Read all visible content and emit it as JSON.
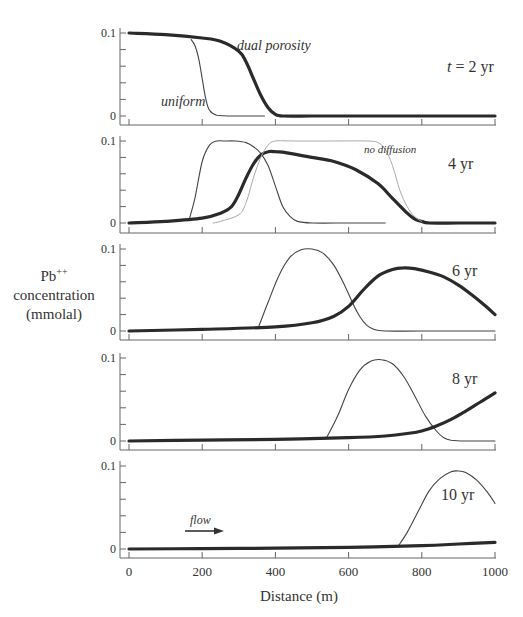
{
  "chart_data": {
    "type": "line",
    "title": "",
    "xlabel": "Distance (m)",
    "ylabel": "Pb++ concentration (mmolal)",
    "ylabel_parts": {
      "main": "Pb",
      "sup": "++",
      "line2": "concentration",
      "line3": "(mmolal)"
    },
    "xlim": [
      0,
      1000
    ],
    "ylim": [
      0,
      0.1
    ],
    "x_ticks": [
      0,
      200,
      400,
      600,
      800,
      1000
    ],
    "x_tick_labels": [
      "0",
      "200",
      "400",
      "600",
      "800",
      "1000"
    ],
    "y_tick_labels": [
      "0",
      "0.1"
    ],
    "grid": false,
    "annotation_flow": "flow",
    "panels": [
      {
        "label": "t = 2 yr",
        "series": [
          {
            "name": "dual porosity",
            "style": "thick",
            "x": [
              0,
              100,
              200,
              250,
              300,
              320,
              340,
              360,
              380,
              400,
              420,
              500,
              600,
              700,
              800,
              900,
              1000
            ],
            "y": [
              0.1,
              0.098,
              0.094,
              0.09,
              0.078,
              0.065,
              0.045,
              0.025,
              0.01,
              0.002,
              0,
              0,
              0,
              0,
              0,
              0,
              0
            ]
          },
          {
            "name": "uniform",
            "style": "thin",
            "x": [
              170,
              180,
              190,
              200,
              210,
              220,
              240,
              300,
              370
            ],
            "y": [
              0.092,
              0.085,
              0.07,
              0.045,
              0.02,
              0.007,
              0.001,
              0,
              0
            ]
          }
        ],
        "annotations": [
          {
            "text": "dual porosity",
            "x": 300,
            "y": 0.092
          },
          {
            "text": "uniform",
            "x": 115,
            "y": 0.02
          }
        ]
      },
      {
        "label": "4 yr",
        "series": [
          {
            "name": "uniform",
            "style": "thin",
            "x": [
              165,
              180,
              200,
              220,
              240,
              260,
              290,
              320,
              340,
              360,
              380,
              400,
              420,
              440,
              460,
              500,
              600,
              700
            ],
            "y": [
              0.005,
              0.03,
              0.075,
              0.095,
              0.1,
              0.1,
              0.1,
              0.098,
              0.093,
              0.085,
              0.07,
              0.045,
              0.02,
              0.008,
              0.002,
              0,
              0,
              0
            ],
            "peak": 0.1
          },
          {
            "name": "dual porosity",
            "style": "thick",
            "x": [
              0,
              100,
              200,
              250,
              280,
              300,
              320,
              340,
              360,
              380,
              400,
              440,
              500,
              560,
              620,
              680,
              720,
              760,
              780,
              800,
              820,
              900,
              1000
            ],
            "y": [
              0,
              0.002,
              0.006,
              0.012,
              0.02,
              0.035,
              0.055,
              0.072,
              0.083,
              0.087,
              0.087,
              0.085,
              0.08,
              0.075,
              0.065,
              0.048,
              0.03,
              0.012,
              0.005,
              0.002,
              0,
              0,
              0
            ],
            "peak": 0.087
          },
          {
            "name": "no diffusion",
            "style": "light",
            "x": [
              230,
              250,
              300,
              320,
              340,
              360,
              380,
              400,
              450,
              550,
              650,
              680,
              700,
              720,
              740,
              760,
              780,
              800
            ],
            "y": [
              0,
              0.002,
              0.01,
              0.025,
              0.055,
              0.08,
              0.095,
              0.1,
              0.1,
              0.1,
              0.1,
              0.098,
              0.09,
              0.07,
              0.04,
              0.02,
              0.008,
              0.002
            ]
          }
        ],
        "annotations": [
          {
            "text": "no diffusion",
            "x": 640,
            "y": 0.093
          }
        ]
      },
      {
        "label": "6 yr",
        "series": [
          {
            "name": "uniform",
            "style": "thin",
            "x": [
              355,
              380,
              410,
              440,
              470,
              500,
              530,
              560,
              590,
              610,
              630,
              650,
              670,
              700,
              800,
              1000
            ],
            "y": [
              0.006,
              0.035,
              0.068,
              0.09,
              0.099,
              0.1,
              0.095,
              0.08,
              0.055,
              0.035,
              0.018,
              0.007,
              0.002,
              0,
              0,
              0
            ],
            "peak": 0.1
          },
          {
            "name": "dual porosity",
            "style": "thick",
            "x": [
              0,
              200,
              400,
              500,
              560,
              600,
              640,
              680,
              720,
              750,
              780,
              820,
              860,
              900,
              940,
              970,
              1000
            ],
            "y": [
              0,
              0.002,
              0.005,
              0.01,
              0.018,
              0.03,
              0.05,
              0.067,
              0.075,
              0.077,
              0.076,
              0.072,
              0.066,
              0.056,
              0.043,
              0.032,
              0.02
            ],
            "peak": 0.077
          }
        ]
      },
      {
        "label": "8 yr",
        "series": [
          {
            "name": "uniform",
            "style": "thin",
            "x": [
              540,
              570,
              600,
              630,
              660,
              690,
              720,
              750,
              780,
              810,
              840,
              860,
              880,
              920,
              1000
            ],
            "y": [
              0.004,
              0.03,
              0.062,
              0.085,
              0.096,
              0.098,
              0.093,
              0.078,
              0.055,
              0.03,
              0.012,
              0.004,
              0.001,
              0,
              0
            ],
            "peak": 0.097
          },
          {
            "name": "dual porosity",
            "style": "thick",
            "x": [
              0,
              200,
              400,
              600,
              700,
              760,
              800,
              840,
              880,
              920,
              960,
              1000
            ],
            "y": [
              0,
              0.001,
              0.002,
              0.004,
              0.006,
              0.009,
              0.012,
              0.018,
              0.026,
              0.036,
              0.047,
              0.058
            ],
            "end": 0.058
          }
        ]
      },
      {
        "label": "10 yr",
        "series": [
          {
            "name": "uniform",
            "style": "thin",
            "x": [
              735,
              760,
              790,
              820,
              850,
              880,
              900,
              920,
              950,
              980,
              1000
            ],
            "y": [
              0.003,
              0.02,
              0.045,
              0.07,
              0.085,
              0.093,
              0.094,
              0.092,
              0.083,
              0.068,
              0.055
            ],
            "peak": 0.094
          },
          {
            "name": "dual porosity",
            "style": "thick",
            "x": [
              0,
              200,
              400,
              600,
              800,
              900,
              1000
            ],
            "y": [
              0,
              0.0005,
              0.001,
              0.002,
              0.004,
              0.006,
              0.008
            ],
            "end": 0.008
          }
        ]
      }
    ]
  }
}
